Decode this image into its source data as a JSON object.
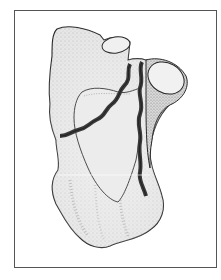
{
  "figure": {
    "type": "line-art medical illustration",
    "caption": "",
    "colors": {
      "frame": "#555555",
      "bone_fill": "#e4e4e4",
      "bone_shadow": "#cfcfcf",
      "articular_fill": "#efefef",
      "outline": "#2a2a2a",
      "fracture": "#3a3a3a",
      "background": "#ffffff"
    },
    "fracture_lines": [
      {
        "name": "oblique-fracture",
        "from": [
          128,
          65
        ],
        "to": [
          58,
          137
        ]
      },
      {
        "name": "vertical-fracture",
        "from": [
          141,
          62
        ],
        "to": [
          146,
          196
        ]
      }
    ]
  }
}
